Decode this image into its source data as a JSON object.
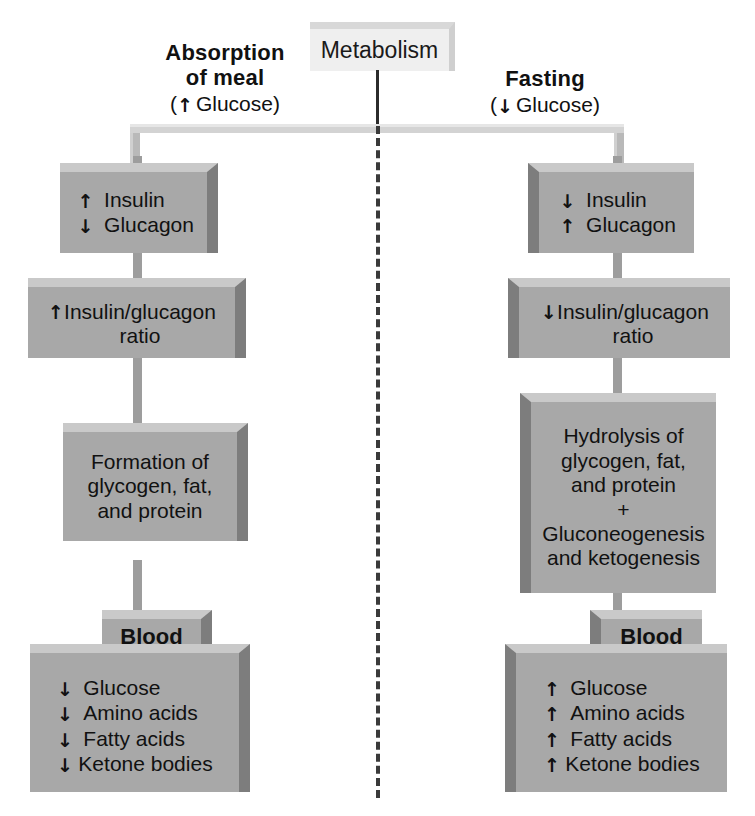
{
  "diagram": {
    "title": "Metabolism",
    "columns": [
      {
        "id": "absorption",
        "header_line1": "Absorption",
        "header_line2": "of meal",
        "header_sub": "(↑ Glucose)",
        "sub_arrow": "↑",
        "sub_text_before": "(",
        "sub_text_after": " Glucose)",
        "hormones": {
          "rows": [
            {
              "arrow": "↑",
              "label": "Insulin"
            },
            {
              "arrow": "↓",
              "label": "Glucagon"
            }
          ]
        },
        "ratio": {
          "arrow": "↑",
          "label": "Insulin/glucagon\nratio",
          "line1": "Insulin/glucagon",
          "line2": "ratio"
        },
        "process": {
          "lines": [
            "Formation of",
            "glycogen, fat,",
            "and protein"
          ]
        },
        "blood": {
          "title": "Blood",
          "rows": [
            {
              "arrow": "↓",
              "label": "Glucose"
            },
            {
              "arrow": "↓",
              "label": "Amino acids"
            },
            {
              "arrow": "↓",
              "label": "Fatty acids"
            },
            {
              "arrow": "↓",
              "label": "Ketone bodies"
            }
          ]
        }
      },
      {
        "id": "fasting",
        "header_line1": "Fasting",
        "header_line2": "",
        "header_sub": "(↓ Glucose)",
        "sub_arrow": "↓",
        "sub_text_before": "(",
        "sub_text_after": " Glucose)",
        "hormones": {
          "rows": [
            {
              "arrow": "↓",
              "label": "Insulin"
            },
            {
              "arrow": "↑",
              "label": "Glucagon"
            }
          ]
        },
        "ratio": {
          "arrow": "↓",
          "label": "Insulin/glucagon\nratio",
          "line1": "Insulin/glucagon",
          "line2": "ratio"
        },
        "process": {
          "lines": [
            "Hydrolysis of",
            "glycogen, fat,",
            "and protein",
            "+",
            "Gluconeogenesis",
            "and ketogenesis"
          ]
        },
        "blood": {
          "title": "Blood",
          "rows": [
            {
              "arrow": "↑",
              "label": "Glucose"
            },
            {
              "arrow": "↑",
              "label": "Amino acids"
            },
            {
              "arrow": "↑",
              "label": "Fatty acids"
            },
            {
              "arrow": "↑",
              "label": "Ketone bodies"
            }
          ]
        }
      }
    ],
    "colors": {
      "box_fill": "#a8a8a8",
      "box_highlight": "#c9c9c9",
      "box_shadow": "#7d7d7d",
      "pale_fill": "#efefef",
      "connector": "#9d9d9d",
      "divider": "#3a3a3a",
      "background": "#ffffff",
      "text": "#111111"
    }
  }
}
